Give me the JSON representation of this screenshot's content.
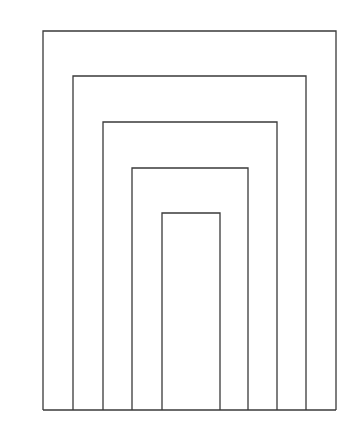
{
  "diagram": {
    "stroke_color": "#3a3a3a",
    "background": "#ffffff",
    "baseline_y": 410,
    "rectangles": [
      {
        "left": 43,
        "top": 31,
        "right": 336
      },
      {
        "left": 73,
        "top": 76,
        "right": 306
      },
      {
        "left": 103,
        "top": 122,
        "right": 277
      },
      {
        "left": 132,
        "top": 168,
        "right": 248
      },
      {
        "left": 162,
        "top": 213,
        "right": 220
      }
    ]
  }
}
